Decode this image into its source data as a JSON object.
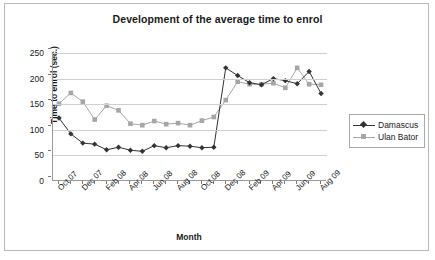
{
  "chart_data": {
    "type": "line",
    "title": "Development of the average time to enrol",
    "xlabel": "Month",
    "ylabel": "Time to enrol (sec.)",
    "ylim": [
      0,
      250
    ],
    "y_ticks": [
      0,
      50,
      100,
      150,
      200,
      250
    ],
    "grid": true,
    "legend_position": "right",
    "categories": [
      "Oct 07",
      "Nov 07",
      "Dec 07",
      "Jan 08",
      "Feb 08",
      "Mar 08",
      "Apr 08",
      "May 08",
      "Jun 08",
      "Jul 08",
      "Aug 08",
      "Sep 08",
      "Oct 08",
      "Nov 08",
      "Dec 08",
      "Jan 09",
      "Feb 09",
      "Mar 09",
      "Apr 09",
      "May 09",
      "Jun 09",
      "Jul 09",
      "Aug 09"
    ],
    "tick_labels": [
      "Oct 07",
      "Dec 07",
      "Feb 08",
      "Apr 08",
      "Jun 08",
      "Aug 08",
      "Oct 08",
      "Dec 08",
      "Feb 09",
      "Apr 09",
      "Jun 09",
      "Aug 09"
    ],
    "series": [
      {
        "name": "Damascus",
        "color": "#333333",
        "marker": "diamond",
        "values": [
          123,
          92,
          74,
          72,
          61,
          66,
          60,
          58,
          69,
          65,
          69,
          68,
          65,
          66,
          221,
          206,
          192,
          188,
          200,
          196,
          190,
          214,
          171
        ]
      },
      {
        "name": "Ulan Bator",
        "color": "#a6a6a6",
        "marker": "square",
        "values": [
          151,
          172,
          155,
          120,
          147,
          138,
          112,
          109,
          117,
          111,
          113,
          109,
          118,
          125,
          158,
          194,
          189,
          189,
          191,
          182,
          221,
          189,
          188
        ]
      }
    ]
  },
  "legend": {
    "items": [
      {
        "label": "Damascus"
      },
      {
        "label": "Ulan Bator"
      }
    ]
  }
}
